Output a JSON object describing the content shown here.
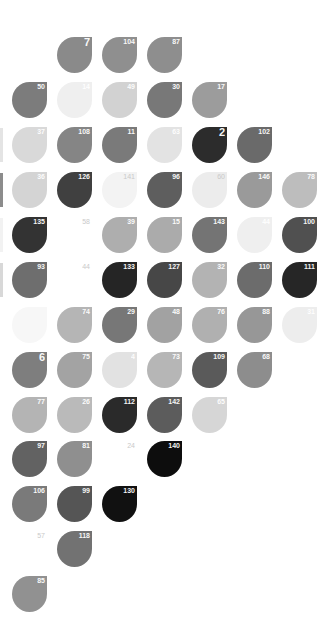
{
  "layout": {
    "col_x": [
      12,
      57,
      102,
      147,
      192,
      237,
      282
    ],
    "row_y": [
      37,
      82,
      127,
      172,
      217,
      262,
      307,
      352,
      397,
      441,
      486,
      531,
      576
    ]
  },
  "edge_fragments": [
    {
      "row": 2,
      "color": "#e4e4e4"
    },
    {
      "row": 3,
      "color": "#8c8c8c"
    },
    {
      "row": 4,
      "color": "#f2f2f2"
    },
    {
      "row": 5,
      "color": "#d8d8d8"
    }
  ],
  "tiles": [
    {
      "label": "7",
      "row": 0,
      "col": 1,
      "color": "#8a8a8a",
      "big": true
    },
    {
      "label": "104",
      "row": 0,
      "col": 2,
      "color": "#8f8f8f"
    },
    {
      "label": "87",
      "row": 0,
      "col": 3,
      "color": "#8e8e8e"
    },
    {
      "label": "50",
      "row": 1,
      "col": 0,
      "color": "#7c7c7c"
    },
    {
      "label": "14",
      "row": 1,
      "col": 1,
      "color": "#efefef"
    },
    {
      "label": "49",
      "row": 1,
      "col": 2,
      "color": "#d2d2d2"
    },
    {
      "label": "30",
      "row": 1,
      "col": 3,
      "color": "#787878"
    },
    {
      "label": "17",
      "row": 1,
      "col": 4,
      "color": "#9c9c9c"
    },
    {
      "label": "37",
      "row": 2,
      "col": 0,
      "color": "#d9d9d9"
    },
    {
      "label": "108",
      "row": 2,
      "col": 1,
      "color": "#858585"
    },
    {
      "label": "11",
      "row": 2,
      "col": 2,
      "color": "#7a7a7a"
    },
    {
      "label": "63",
      "row": 2,
      "col": 3,
      "color": "#e3e3e3"
    },
    {
      "label": "2",
      "row": 2,
      "col": 4,
      "color": "#2c2c2c",
      "big": true
    },
    {
      "label": "102",
      "row": 2,
      "col": 5,
      "color": "#6a6a6a"
    },
    {
      "label": "36",
      "row": 3,
      "col": 0,
      "color": "#d4d4d4"
    },
    {
      "label": "126",
      "row": 3,
      "col": 1,
      "color": "#404040"
    },
    {
      "label": "141",
      "row": 3,
      "col": 2,
      "color": "#f3f3f3",
      "ghost": true
    },
    {
      "label": "96",
      "row": 3,
      "col": 3,
      "color": "#5e5e5e"
    },
    {
      "label": "60",
      "row": 3,
      "col": 4,
      "color": "#ececec",
      "ghost": true
    },
    {
      "label": "146",
      "row": 3,
      "col": 5,
      "color": "#9a9a9a"
    },
    {
      "label": "78",
      "row": 3,
      "col": 6,
      "color": "#bdbdbd"
    },
    {
      "label": "135",
      "row": 4,
      "col": 0,
      "color": "#333333"
    },
    {
      "label": "58",
      "row": 4,
      "col": 1,
      "color": "#ffffff",
      "ghost": true
    },
    {
      "label": "39",
      "row": 4,
      "col": 2,
      "color": "#aeaeae"
    },
    {
      "label": "15",
      "row": 4,
      "col": 3,
      "color": "#ababab"
    },
    {
      "label": "143",
      "row": 4,
      "col": 4,
      "color": "#747474"
    },
    {
      "label": "44",
      "row": 4,
      "col": 5,
      "color": "#efefef"
    },
    {
      "label": "100",
      "row": 4,
      "col": 6,
      "color": "#505050"
    },
    {
      "label": "93",
      "row": 5,
      "col": 0,
      "color": "#6e6e6e"
    },
    {
      "label": "44",
      "row": 5,
      "col": 1,
      "color": "#ffffff",
      "ghost": true
    },
    {
      "label": "133",
      "row": 5,
      "col": 2,
      "color": "#252525"
    },
    {
      "label": "127",
      "row": 5,
      "col": 3,
      "color": "#474747"
    },
    {
      "label": "32",
      "row": 5,
      "col": 4,
      "color": "#b3b3b3"
    },
    {
      "label": "110",
      "row": 5,
      "col": 5,
      "color": "#6c6c6c"
    },
    {
      "label": "111",
      "row": 5,
      "col": 6,
      "color": "#262626"
    },
    {
      "label": "",
      "row": 6,
      "col": 0,
      "color": "#f7f7f7"
    },
    {
      "label": "74",
      "row": 6,
      "col": 1,
      "color": "#b5b5b5"
    },
    {
      "label": "29",
      "row": 6,
      "col": 2,
      "color": "#777777"
    },
    {
      "label": "48",
      "row": 6,
      "col": 3,
      "color": "#a2a2a2"
    },
    {
      "label": "76",
      "row": 6,
      "col": 4,
      "color": "#b0b0b0"
    },
    {
      "label": "88",
      "row": 6,
      "col": 5,
      "color": "#979797"
    },
    {
      "label": "31",
      "row": 6,
      "col": 6,
      "color": "#ededed"
    },
    {
      "label": "6",
      "row": 7,
      "col": 0,
      "color": "#7e7e7e",
      "big": true
    },
    {
      "label": "75",
      "row": 7,
      "col": 1,
      "color": "#a3a3a3"
    },
    {
      "label": "4",
      "row": 7,
      "col": 2,
      "color": "#e2e2e2"
    },
    {
      "label": "73",
      "row": 7,
      "col": 3,
      "color": "#b6b6b6"
    },
    {
      "label": "109",
      "row": 7,
      "col": 4,
      "color": "#5a5a5a"
    },
    {
      "label": "68",
      "row": 7,
      "col": 5,
      "color": "#8d8d8d"
    },
    {
      "label": "77",
      "row": 8,
      "col": 0,
      "color": "#b4b4b4"
    },
    {
      "label": "26",
      "row": 8,
      "col": 1,
      "color": "#bababa"
    },
    {
      "label": "112",
      "row": 8,
      "col": 2,
      "color": "#2a2a2a"
    },
    {
      "label": "142",
      "row": 8,
      "col": 3,
      "color": "#5c5c5c"
    },
    {
      "label": "65",
      "row": 8,
      "col": 4,
      "color": "#d6d6d6"
    },
    {
      "label": "97",
      "row": 9,
      "col": 0,
      "color": "#626262"
    },
    {
      "label": "81",
      "row": 9,
      "col": 1,
      "color": "#8f8f8f"
    },
    {
      "label": "24",
      "row": 9,
      "col": 2,
      "color": "#ffffff",
      "ghost": true
    },
    {
      "label": "140",
      "row": 9,
      "col": 3,
      "color": "#0d0d0d"
    },
    {
      "label": "106",
      "row": 10,
      "col": 0,
      "color": "#7a7a7a"
    },
    {
      "label": "99",
      "row": 10,
      "col": 1,
      "color": "#555555"
    },
    {
      "label": "130",
      "row": 10,
      "col": 2,
      "color": "#111111"
    },
    {
      "label": "57",
      "row": 11,
      "col": 0,
      "color": "#ffffff",
      "ghost": true
    },
    {
      "label": "118",
      "row": 11,
      "col": 1,
      "color": "#727272"
    },
    {
      "label": "85",
      "row": 12,
      "col": 0,
      "color": "#919191"
    }
  ]
}
